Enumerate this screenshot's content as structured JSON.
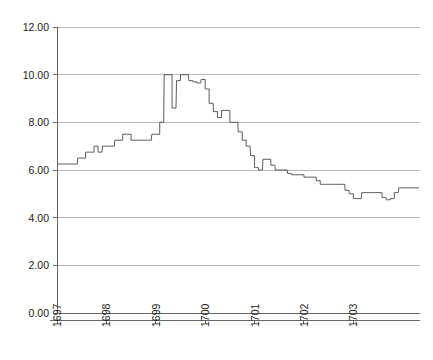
{
  "chart_data": {
    "type": "line",
    "subtype": "step-post",
    "title": "",
    "subtitle": "",
    "xlabel": "",
    "ylabel": "",
    "xlim": [
      1697.0,
      1704.35
    ],
    "ylim": [
      0.0,
      12.0
    ],
    "grid": true,
    "grid_axis": "y",
    "legend": false,
    "legend_position": "none",
    "line_color": "#4a4a4a",
    "grid_color": "#9a9a9a",
    "axis_color": "#555555",
    "background_color": "#ffffff",
    "yticks": [
      0.0,
      2.0,
      4.0,
      6.0,
      8.0,
      10.0,
      12.0
    ],
    "ytick_labels": [
      "0.00",
      "2.00",
      "4.00",
      "6.00",
      "8.00",
      "10.00",
      "12.00"
    ],
    "xticks": [
      1697,
      1698,
      1699,
      1700,
      1701,
      1702,
      1703
    ],
    "xtick_labels": [
      "1697",
      "1698",
      "1699",
      "1700",
      "1701",
      "1702",
      "1703"
    ],
    "xtick_rotation": -90,
    "series": [
      {
        "name": "value",
        "x": [
          1697.0,
          1697.08,
          1697.17,
          1697.25,
          1697.33,
          1697.42,
          1697.5,
          1697.58,
          1697.67,
          1697.75,
          1697.83,
          1697.92,
          1698.0,
          1698.08,
          1698.17,
          1698.25,
          1698.33,
          1698.42,
          1698.5,
          1698.58,
          1698.67,
          1698.75,
          1698.83,
          1698.92,
          1699.0,
          1699.08,
          1699.17,
          1699.25,
          1699.33,
          1699.42,
          1699.5,
          1699.58,
          1699.67,
          1699.75,
          1699.83,
          1699.92,
          1700.0,
          1700.08,
          1700.17,
          1700.25,
          1700.33,
          1700.42,
          1700.5,
          1700.58,
          1700.67,
          1700.75,
          1700.83,
          1700.92,
          1701.0,
          1701.08,
          1701.17,
          1701.25,
          1701.33,
          1701.42,
          1701.5,
          1701.58,
          1701.67,
          1701.75,
          1701.83,
          1701.92,
          1702.0,
          1702.08,
          1702.17,
          1702.25,
          1702.33,
          1702.42,
          1702.5,
          1702.58,
          1702.67,
          1702.75,
          1702.83,
          1702.92,
          1703.0,
          1703.08,
          1703.17,
          1703.25,
          1703.33,
          1703.42,
          1703.5,
          1703.58,
          1703.67,
          1703.75,
          1703.83,
          1703.92,
          1704.0,
          1704.08,
          1704.17,
          1704.25
        ],
        "values": [
          6.25,
          6.25,
          6.25,
          6.25,
          6.25,
          6.5,
          6.5,
          6.75,
          6.75,
          7.0,
          6.75,
          7.0,
          7.0,
          7.0,
          7.25,
          7.25,
          7.5,
          7.5,
          7.25,
          7.25,
          7.25,
          7.25,
          7.25,
          7.5,
          7.5,
          8.0,
          10.0,
          10.0,
          8.6,
          9.75,
          10.0,
          10.0,
          9.75,
          9.7,
          9.65,
          9.8,
          9.4,
          8.8,
          8.45,
          8.2,
          8.5,
          8.5,
          8.0,
          8.0,
          7.6,
          7.25,
          7.0,
          6.6,
          6.1,
          6.0,
          6.45,
          6.45,
          6.2,
          6.0,
          6.0,
          6.0,
          5.85,
          5.8,
          5.8,
          5.8,
          5.7,
          5.7,
          5.7,
          5.55,
          5.4,
          5.4,
          5.4,
          5.4,
          5.4,
          5.4,
          5.15,
          5.0,
          4.8,
          4.8,
          5.05,
          5.05,
          5.05,
          5.05,
          5.05,
          4.85,
          4.75,
          4.8,
          5.05,
          5.25,
          5.25,
          5.25,
          5.25,
          5.25
        ]
      }
    ],
    "annotations": [],
    "notes": {
      "series_shape": "Monthly step series: flat near 6.25 through early 1697, stepping up to ~7.5 by late 1698, sharp twin spikes to 10.00 in 1699 with an intervening dip to ~8.6, gradual decline through 1700-1701 back below 6.00, trough near 4.75 in late 1703, recovering to ~5.25 by 1704."
    }
  }
}
